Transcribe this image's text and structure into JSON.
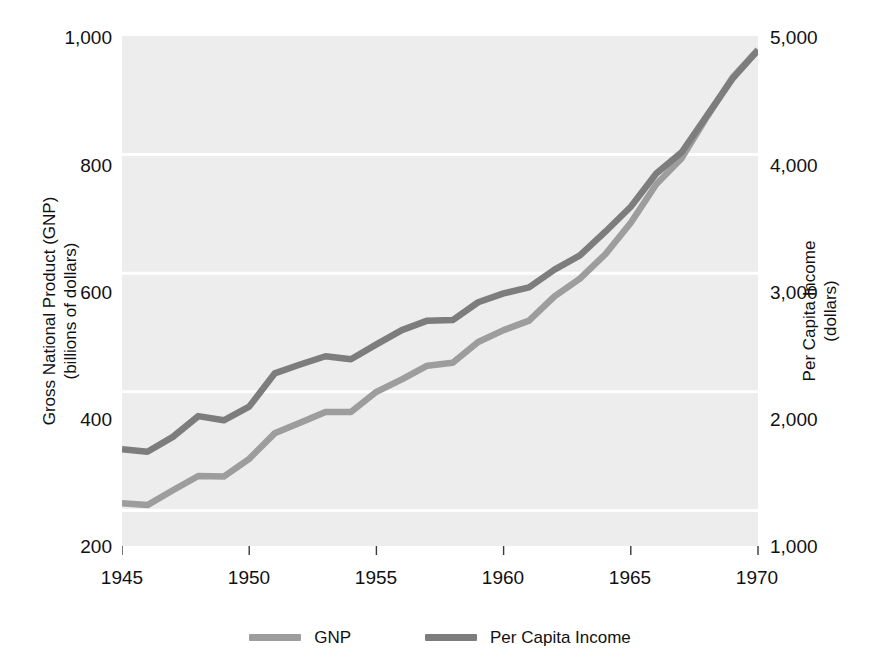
{
  "chart_data": {
    "type": "line",
    "title": "",
    "xlabel": "",
    "x": [
      1945,
      1946,
      1947,
      1948,
      1949,
      1950,
      1951,
      1952,
      1953,
      1954,
      1955,
      1956,
      1957,
      1958,
      1959,
      1960,
      1961,
      1962,
      1963,
      1964,
      1965,
      1966,
      1967,
      1968,
      1969,
      1970
    ],
    "xlim": [
      1945,
      1970
    ],
    "xticks": [
      1945,
      1950,
      1955,
      1960,
      1965,
      1970
    ],
    "xticklabels": [
      "1945",
      "1950",
      "1955",
      "1960",
      "1965",
      "1970"
    ],
    "grid": true,
    "grid_color": "#ffffff",
    "plot_background": "#ededed",
    "legend_position": "bottom-center",
    "axes": [
      {
        "side": "left",
        "label_line1": "Gross National Product (GNP)",
        "label_line2": "(billions of dollars)",
        "ylim": [
          140,
          1000
        ],
        "yticks": [
          200,
          400,
          600,
          800,
          1000
        ],
        "yticklabels": [
          "200",
          "400",
          "600",
          "800",
          "1,000"
        ]
      },
      {
        "side": "right",
        "label_line1": "Per Capita Income",
        "label_line2": "(dollars)",
        "ylim": [
          700,
          5000
        ],
        "yticks": [
          1000,
          2000,
          3000,
          4000,
          5000
        ],
        "yticklabels": [
          "1,000",
          "2,000",
          "3,000",
          "4,000",
          "5,000"
        ]
      }
    ],
    "series": [
      {
        "name": "GNP",
        "axis": "left",
        "color": "#9d9d9d",
        "unit": "billions of dollars",
        "values": [
          212,
          209,
          234,
          258,
          257,
          287,
          330,
          348,
          366,
          366,
          400,
          421,
          444,
          449,
          484,
          504,
          520,
          561,
          591,
          632,
          685,
          750,
          794,
          864,
          930,
          977
        ]
      },
      {
        "name": "Per Capita Income",
        "axis": "right",
        "color": "#7d7d7d",
        "unit": "dollars",
        "values": [
          1515,
          1495,
          1620,
          1795,
          1760,
          1875,
          2155,
          2230,
          2300,
          2275,
          2400,
          2520,
          2600,
          2605,
          2755,
          2830,
          2880,
          3030,
          3150,
          3350,
          3560,
          3840,
          4020,
          4330,
          4640,
          4880
        ]
      }
    ]
  },
  "legend": {
    "entries": [
      {
        "label": "GNP",
        "color": "#9d9d9d"
      },
      {
        "label": "Per Capita Income",
        "color": "#7d7d7d"
      }
    ]
  },
  "y_left": {
    "title_line1": "Gross National Product (GNP)",
    "title_line2": "(billions of dollars)",
    "ticks": [
      "1,000",
      "800",
      "600",
      "400",
      "200"
    ]
  },
  "y_right": {
    "title_line1": "Per Capita Income",
    "title_line2": "(dollars)",
    "ticks": [
      "5,000",
      "4,000",
      "3,000",
      "2,000",
      "1,000"
    ]
  },
  "x_axis": {
    "ticks": [
      "1945",
      "1950",
      "1955",
      "1960",
      "1965",
      "1970"
    ]
  }
}
